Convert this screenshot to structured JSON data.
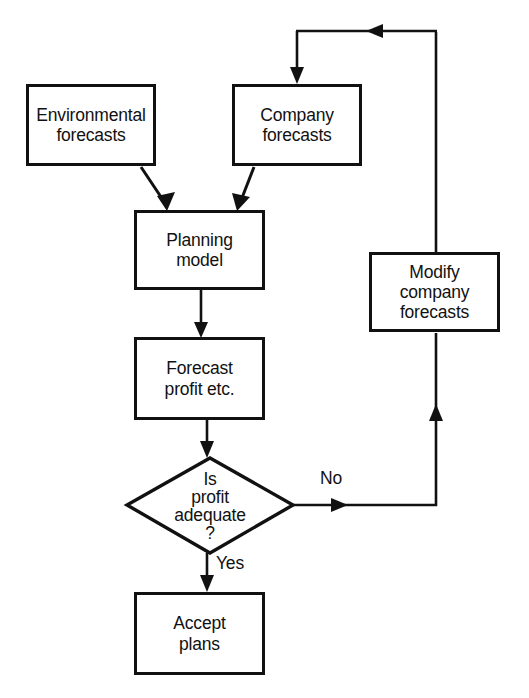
{
  "diagram": {
    "type": "flowchart",
    "background_color": "#ffffff",
    "line_color": "#111111",
    "text_color": "#111111",
    "nodes": [
      {
        "id": "environmental_forecasts",
        "shape": "rectangle",
        "label": "Environmental\nforecasts",
        "x": 26,
        "y": 84,
        "width": 130,
        "height": 82
      },
      {
        "id": "company_forecasts",
        "shape": "rectangle",
        "label": "Company\nforecasts",
        "x": 232,
        "y": 84,
        "width": 130,
        "height": 82
      },
      {
        "id": "planning_model",
        "shape": "rectangle",
        "label": "Planning\nmodel",
        "x": 134,
        "y": 210,
        "width": 131,
        "height": 80
      },
      {
        "id": "forecast_profit",
        "shape": "rectangle",
        "label": "Forecast\nprofit etc.",
        "x": 134,
        "y": 337,
        "width": 131,
        "height": 83
      },
      {
        "id": "is_profit_adequate",
        "shape": "diamond",
        "label": "Is\nprofit\nadequate\n?",
        "x": 127,
        "y": 458,
        "width": 166,
        "height": 95
      },
      {
        "id": "accept_plans",
        "shape": "rectangle",
        "label": "Accept\nplans",
        "x": 134,
        "y": 592,
        "width": 131,
        "height": 83
      },
      {
        "id": "modify_company_forecasts",
        "shape": "rectangle",
        "label": "Modify\ncompany\nforecasts",
        "x": 369,
        "y": 252,
        "width": 131,
        "height": 80
      }
    ],
    "edge_labels": [
      {
        "id": "no_label",
        "text": "No",
        "x": 320,
        "y": 468
      },
      {
        "id": "yes_label",
        "text": "Yes",
        "x": 216,
        "y": 553
      }
    ],
    "edges": [
      {
        "id": "env-to-planning",
        "from": "environmental_forecasts",
        "to": "planning_model",
        "label": ""
      },
      {
        "id": "company-to-planning",
        "from": "company_forecasts",
        "to": "planning_model",
        "label": ""
      },
      {
        "id": "planning-to-forecast",
        "from": "planning_model",
        "to": "forecast_profit",
        "label": ""
      },
      {
        "id": "forecast-to-decision",
        "from": "forecast_profit",
        "to": "is_profit_adequate",
        "label": ""
      },
      {
        "id": "decision-no-to-modify",
        "from": "is_profit_adequate",
        "to": "modify_company_forecasts",
        "label": "No"
      },
      {
        "id": "decision-yes-to-accept",
        "from": "is_profit_adequate",
        "to": "accept_plans",
        "label": "Yes"
      },
      {
        "id": "modify-to-company",
        "from": "modify_company_forecasts",
        "to": "company_forecasts",
        "label": ""
      }
    ]
  }
}
